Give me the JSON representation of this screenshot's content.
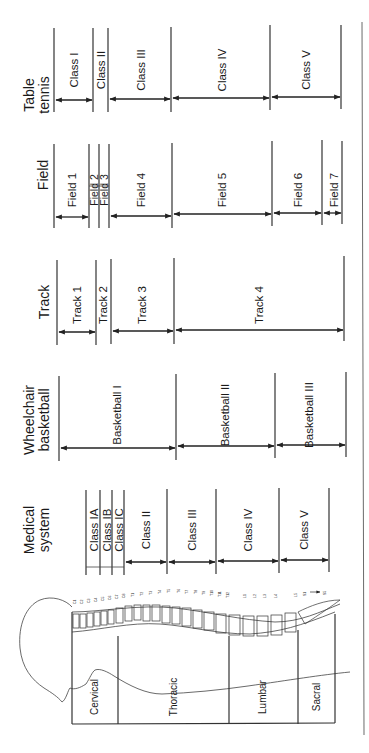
{
  "diagram": {
    "orientation": "rotated 90 degrees counter-clockwise; text reads bottom-to-top",
    "columns": [
      {
        "key": "table_tennis",
        "header": [
          "Table",
          "tennis"
        ],
        "classes": [
          "Class I",
          "Class II",
          "Class III",
          "Class IV",
          "Class V"
        ]
      },
      {
        "key": "field",
        "header": [
          "Field"
        ],
        "classes": [
          "Field 1",
          "Field 2",
          "Field 3",
          "Field 4",
          "Field 5",
          "Field 6",
          "Field 7"
        ]
      },
      {
        "key": "track",
        "header": [
          "Track"
        ],
        "classes": [
          "Track 1",
          "Track 2",
          "Track 3",
          "Track 4"
        ]
      },
      {
        "key": "wheelchair_basketball",
        "header": [
          "Wheelchair",
          "basketball"
        ],
        "classes": [
          "Basketball I",
          "Basketball II",
          "Basketball III"
        ]
      },
      {
        "key": "medical_system",
        "header": [
          "Medical",
          "system"
        ],
        "classes": [
          "Class IA",
          "Class IB",
          "Class IC",
          "Class II",
          "Class III",
          "Class IV",
          "Class V"
        ]
      }
    ],
    "spine_regions": [
      "Cervical",
      "Thoracic",
      "Lumbar",
      "Sacral"
    ],
    "vertebra_labels": {
      "cervical": [
        "C1",
        "C2",
        "C3",
        "C4",
        "C5",
        "C6",
        "C7",
        "C8"
      ],
      "thoracic": [
        "T1",
        "T2",
        "T3",
        "T4",
        "T5",
        "T6",
        "T7",
        "T8",
        "T9",
        "T10",
        "T11",
        "T12"
      ],
      "lumbar": [
        "L1",
        "L2",
        "L3",
        "L4",
        "L5"
      ],
      "sacral": [
        "S1",
        "S5"
      ]
    }
  },
  "labels": {
    "tt_header_1": "Table",
    "tt_header_2": "tennis",
    "tt_c1": "Class I",
    "tt_c2": "Class II",
    "tt_c3": "Class III",
    "tt_c4": "Class IV",
    "tt_c5": "Class V",
    "field_header": "Field",
    "f1": "Field 1",
    "f2": "Field 2",
    "f3": "Field 3",
    "f4": "Field 4",
    "f5": "Field 5",
    "f6": "Field 6",
    "f7": "Field 7",
    "track_header": "Track",
    "t1": "Track 1",
    "t2": "Track 2",
    "t3": "Track 3",
    "t4": "Track 4",
    "wb_header_1": "Wheelchair",
    "wb_header_2": "basketball",
    "b1": "Basketball I",
    "b2": "Basketball II",
    "b3": "Basketball III",
    "med_header_1": "Medical",
    "med_header_2": "system",
    "m1a": "Class IA",
    "m1b": "Class IB",
    "m1c": "Class IC",
    "m2": "Class II",
    "m3": "Class III",
    "m4": "Class IV",
    "m5": "Class V",
    "cervical": "Cervical",
    "thoracic": "Thoracic",
    "lumbar": "Lumbar",
    "sacral": "Sacral",
    "s5": "S5"
  }
}
